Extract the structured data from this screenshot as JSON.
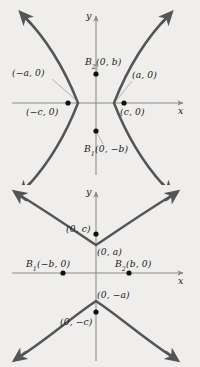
{
  "figure": {
    "background_color": "#efeeec",
    "curve_color": "#555555",
    "axis_color": "#8a8a8a",
    "point_color": "#111111",
    "leader_color": "#9a9a9a"
  },
  "panels": [
    {
      "id": "horizontal-hyperbola",
      "name": "hyperbola-transverse-horizontal",
      "axes": {
        "x_label": "x",
        "y_label": "y",
        "origin": {
          "x": 96,
          "y": 103
        }
      },
      "labels": {
        "vertex_left": "(−a, 0)",
        "vertex_right": "(a, 0)",
        "focus_left": "(−c, 0)",
        "focus_right": "(c, 0)",
        "covertex_top_name": "B",
        "covertex_top_sub": "2",
        "covertex_top_coords": "(0, b)",
        "covertex_bottom_name": "B",
        "covertex_bottom_sub": "1",
        "covertex_bottom_coords": "(0, −b)"
      },
      "points": [
        {
          "name": "focus-left",
          "label": "(−c, 0)",
          "x": 68,
          "y": 103
        },
        {
          "name": "focus-right",
          "label": "(c, 0)",
          "x": 124,
          "y": 103
        },
        {
          "name": "covertex-top",
          "label": "B2(0, b)",
          "x": 96,
          "y": 74
        },
        {
          "name": "covertex-bottom",
          "label": "B1(0, −b)",
          "x": 96,
          "y": 131
        }
      ],
      "vertices": [
        {
          "name": "vertex-left",
          "label": "(−a, 0)",
          "x": 78,
          "y": 103
        },
        {
          "name": "vertex-right",
          "label": "(a, 0)",
          "x": 114,
          "y": 103
        }
      ]
    },
    {
      "id": "vertical-hyperbola",
      "name": "hyperbola-transverse-vertical",
      "axes": {
        "x_label": "x",
        "y_label": "y",
        "origin": {
          "x": 96,
          "y": 273
        }
      },
      "labels": {
        "vertex_top": "(0, a)",
        "vertex_bottom": "(0, −a)",
        "focus_top": "(0, c)",
        "focus_bottom": "(0, −c)",
        "covertex_left_name": "B",
        "covertex_left_sub": "1",
        "covertex_left_coords": "(−b, 0)",
        "covertex_right_name": "B",
        "covertex_right_sub": "2",
        "covertex_right_coords": "(b, 0)"
      },
      "points": [
        {
          "name": "focus-top",
          "label": "(0, c)",
          "x": 96,
          "y": 234
        },
        {
          "name": "focus-bottom",
          "label": "(0, −c)",
          "x": 96,
          "y": 312
        },
        {
          "name": "covertex-left",
          "label": "B1(−b, 0)",
          "x": 63,
          "y": 273
        },
        {
          "name": "covertex-right",
          "label": "B2(b, 0)",
          "x": 129,
          "y": 273
        }
      ],
      "vertices": [
        {
          "name": "vertex-top",
          "label": "(0, a)",
          "x": 96,
          "y": 245
        },
        {
          "name": "vertex-bottom",
          "label": "(0, −a)",
          "x": 96,
          "y": 301
        }
      ]
    }
  ]
}
